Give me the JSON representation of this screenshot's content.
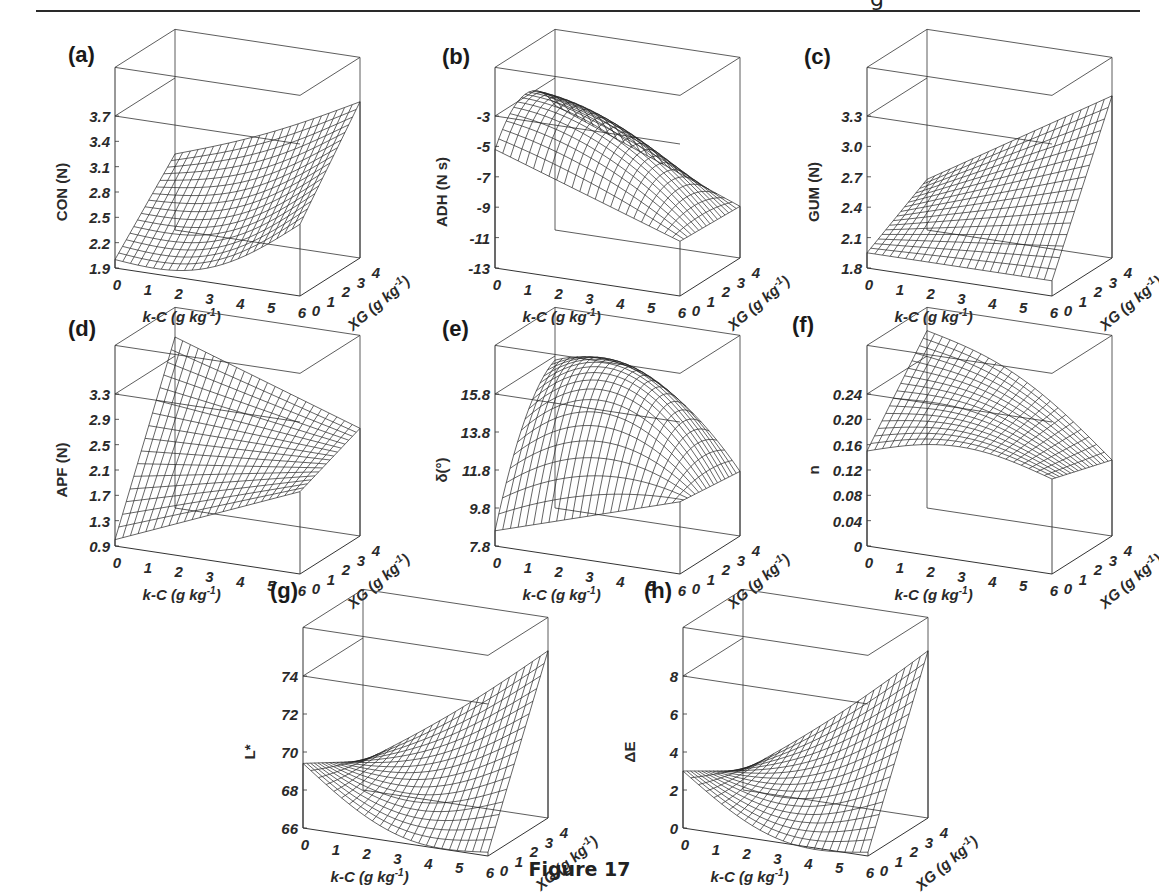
{
  "page": {
    "header_fragment": "g",
    "caption": "Figure 17"
  },
  "chart_data": [
    {
      "id": "a",
      "label": "(a)",
      "type": "surface3d",
      "xlabel": "k-C (g kg-1)",
      "ylabel": "XG (g kg-1)",
      "zlabel": "CON (N)",
      "x_ticks": [
        "0",
        "1",
        "2",
        "3",
        "4",
        "5",
        "6"
      ],
      "y_ticks": [
        "0",
        "1",
        "2",
        "3",
        "4"
      ],
      "z_ticks": [
        "1.9",
        "2.2",
        "2.5",
        "2.8",
        "3.1",
        "3.4",
        "3.7"
      ],
      "zlim": [
        1.9,
        3.7
      ],
      "corners": {
        "kc0_xg0": 2.0,
        "kc6_xg0": 2.75,
        "kc0_xg4": 2.8,
        "kc6_xg4": 3.75
      },
      "shape": "convex increasing in both factors"
    },
    {
      "id": "b",
      "label": "(b)",
      "type": "surface3d",
      "xlabel": "k-C (g kg-1)",
      "ylabel": "XG (g kg-1)",
      "zlabel": "ADH (N s)",
      "x_ticks": [
        "0",
        "1",
        "2",
        "3",
        "4",
        "5",
        "6"
      ],
      "y_ticks": [
        "0",
        "1",
        "2",
        "3",
        "4"
      ],
      "z_ticks": [
        "-13",
        "-11",
        "-9",
        "-7",
        "-5",
        "-3"
      ],
      "zlim": [
        -13,
        -3
      ],
      "corners": {
        "kc0_xg0": -5.2,
        "kc6_xg0": -9.4,
        "kc0_xg4": -4.8,
        "kc6_xg4": -9.6
      },
      "max": {
        "kc": 2,
        "xg": 2,
        "value": -3.6
      },
      "shape": "concave dome, decreasing strongly with k-C"
    },
    {
      "id": "c",
      "label": "(c)",
      "type": "surface3d",
      "xlabel": "k-C (g kg-1)",
      "ylabel": "XG (g kg-1)",
      "zlabel": "GUM (N)",
      "x_ticks": [
        "0",
        "1",
        "2",
        "3",
        "4",
        "5",
        "6"
      ],
      "y_ticks": [
        "0",
        "1",
        "2",
        "3",
        "4"
      ],
      "z_ticks": [
        "1.8",
        "2.1",
        "2.4",
        "2.7",
        "3.0",
        "3.3"
      ],
      "zlim": [
        1.8,
        3.3
      ],
      "corners": {
        "kc0_xg0": 1.95,
        "kc6_xg0": 1.95,
        "kc0_xg4": 2.3,
        "kc6_xg4": 3.4
      },
      "shape": "saddle/twisted plane, maximum at high k-C and high XG"
    },
    {
      "id": "d",
      "label": "(d)",
      "type": "surface3d",
      "xlabel": "k-C (g kg-1)",
      "ylabel": "XG (g kg-1)",
      "zlabel": "APF (N)",
      "x_ticks": [
        "0",
        "1",
        "2",
        "3",
        "4",
        "5",
        "6"
      ],
      "y_ticks": [
        "0",
        "1",
        "2",
        "3",
        "4"
      ],
      "z_ticks": [
        "0.9",
        "1.3",
        "1.7",
        "2.1",
        "2.5",
        "2.9",
        "3.3"
      ],
      "zlim": [
        0.9,
        3.3
      ],
      "corners": {
        "kc0_xg0": 1.0,
        "kc6_xg0": 2.2,
        "kc0_xg4": 3.6,
        "kc6_xg4": 2.6
      },
      "shape": "twisted saddle, maximum at k-C 0 and XG 4"
    },
    {
      "id": "e",
      "label": "(e)",
      "type": "surface3d",
      "xlabel": "k-C (g kg-1)",
      "ylabel": "XG (g kg-1)",
      "zlabel": "δ(°)",
      "x_ticks": [
        "0",
        "1",
        "2",
        "3",
        "4",
        "5",
        "6"
      ],
      "y_ticks": [
        "0",
        "1",
        "2",
        "3",
        "4"
      ],
      "z_ticks": [
        "7.8",
        "9.8",
        "11.8",
        "13.8",
        "15.8"
      ],
      "zlim": [
        7.8,
        15.8
      ],
      "corners": {
        "kc0_xg0": 8.6,
        "kc6_xg0": 11.6,
        "kc0_xg4": 14.2,
        "kc6_xg4": 11.2
      },
      "max": {
        "kc": 2.5,
        "xg": 2.5,
        "value": 16.2
      },
      "shape": "concave dome"
    },
    {
      "id": "f",
      "label": "(f)",
      "type": "surface3d",
      "xlabel": "k-C (g kg-1)",
      "ylabel": "XG (g kg-1)",
      "zlabel": "n",
      "x_ticks": [
        "0",
        "1",
        "2",
        "3",
        "4",
        "5",
        "6"
      ],
      "y_ticks": [
        "0",
        "1",
        "2",
        "3",
        "4"
      ],
      "z_ticks": [
        "0",
        "0.04",
        "0.08",
        "0.12",
        "0.16",
        "0.20",
        "0.24"
      ],
      "zlim": [
        0,
        0.24
      ],
      "corners": {
        "kc0_xg0": 0.15,
        "kc6_xg0": 0.15,
        "kc0_xg4": 0.28,
        "kc6_xg4": 0.12
      },
      "shape": "concave, maximum at low k-C and high XG"
    },
    {
      "id": "g",
      "label": "(g)",
      "type": "surface3d",
      "xlabel": "k-C (g kg-1)",
      "ylabel": "XG (g kg-1)",
      "zlabel": "L*",
      "x_ticks": [
        "0",
        "1",
        "2",
        "3",
        "4",
        "5",
        "6"
      ],
      "y_ticks": [
        "0",
        "1",
        "2",
        "3",
        "4"
      ],
      "z_ticks": [
        "66",
        "68",
        "70",
        "72",
        "74"
      ],
      "zlim": [
        66,
        74
      ],
      "corners": {
        "kc0_xg0": 69.4,
        "kc6_xg0": 66.2,
        "kc0_xg4": 67.5,
        "kc6_xg4": 74.8
      },
      "shape": "convex saddle, maximum at high k-C and high XG"
    },
    {
      "id": "h",
      "label": "(h)",
      "type": "surface3d",
      "xlabel": "k-C (g kg-1)",
      "ylabel": "XG (g kg-1)",
      "zlabel": "ΔE",
      "x_ticks": [
        "0",
        "1",
        "2",
        "3",
        "4",
        "5",
        "6"
      ],
      "y_ticks": [
        "0",
        "1",
        "2",
        "3",
        "4"
      ],
      "z_ticks": [
        "0",
        "2",
        "4",
        "6",
        "8"
      ],
      "zlim": [
        0,
        8
      ],
      "corners": {
        "kc0_xg0": 3.0,
        "kc6_xg0": 0.2,
        "kc0_xg4": 1.0,
        "kc6_xg4": 8.8
      },
      "shape": "convex saddle, maximum at high k-C and high XG"
    }
  ]
}
